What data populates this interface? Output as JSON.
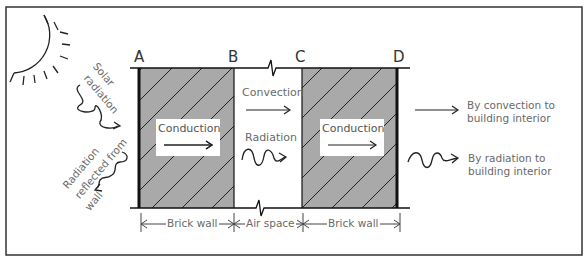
{
  "diagram": {
    "points": {
      "a": "A",
      "b": "B",
      "c": "C",
      "d": "D"
    },
    "outside": {
      "solar": "Solar radiation",
      "solar_line1": "Solar",
      "solar_line2": "radiation",
      "reflected_line1": "Radiation",
      "reflected_line2": "reflected from",
      "reflected_line3": "wall"
    },
    "wall1": {
      "process": "Conduction"
    },
    "air_space": {
      "convection": "Convection",
      "radiation": "Radiation"
    },
    "wall2": {
      "process": "Conduction"
    },
    "interior": {
      "convection_line1": "By convection to",
      "convection_line2": "building interior",
      "radiation_line1": "By radiation to",
      "radiation_line2": "building interior"
    },
    "dimensions": {
      "brick_wall_1": "Brick wall",
      "air_space": "Air space",
      "brick_wall_2": "Brick wall"
    },
    "colors": {
      "brick": "#a9a9a9",
      "line": "#111111",
      "text": "#6a6a6a"
    }
  }
}
